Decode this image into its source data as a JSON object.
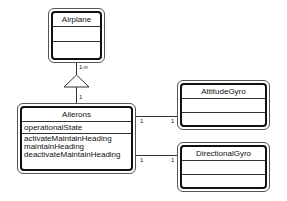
{
  "diagram": {
    "type": "UML class diagram",
    "classes": [
      {
        "name": "Airplane",
        "attributes": [],
        "operations": []
      },
      {
        "name": "Ailerons",
        "attributes": [
          "operationalState"
        ],
        "operations": [
          "activateMaintainHeading",
          "maintainHeading",
          "deactivateMaintainHeading"
        ]
      },
      {
        "name": "AttitudeGyro",
        "attributes": [],
        "operations": []
      },
      {
        "name": "DirectionalGyro",
        "attributes": [],
        "operations": []
      }
    ],
    "relationships": [
      {
        "from": "Ailerons",
        "to": "Airplane",
        "kind": "aggregation-triangle",
        "multiplicity_to": "1-n",
        "multiplicity_from": "1"
      },
      {
        "from": "Ailerons",
        "to": "AttitudeGyro",
        "kind": "association",
        "multiplicity_from": "1",
        "multiplicity_to": "1"
      },
      {
        "from": "Ailerons",
        "to": "DirectionalGyro",
        "kind": "association",
        "multiplicity_from": "1",
        "multiplicity_to": "1"
      }
    ]
  }
}
